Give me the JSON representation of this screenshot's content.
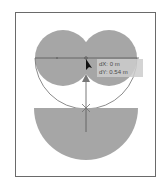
{
  "canvas": {
    "shape_fill": "#a6a6a6",
    "stroke_color": "#6e6e6e",
    "frame_color": "#6a6a6a"
  },
  "tooltip": {
    "dx": "dX: 0 m",
    "dy": "dY: 0.54 m"
  }
}
